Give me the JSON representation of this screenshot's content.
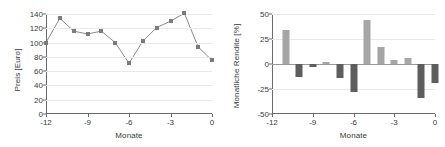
{
  "chart_data": [
    {
      "type": "line",
      "panel": "left",
      "title": "",
      "xlabel": "Monate",
      "ylabel": "Preis [Euro]",
      "x": [
        -12,
        -11,
        -10,
        -9,
        -8,
        -7,
        -6,
        -5,
        -4,
        -3,
        -2,
        -1,
        0
      ],
      "values": [
        100,
        134,
        116,
        112,
        116,
        100,
        71,
        102,
        121,
        130,
        141,
        94,
        75
      ],
      "xlim": [
        -12,
        0
      ],
      "ylim": [
        0,
        140
      ],
      "xticks": [
        -12,
        -9,
        -6,
        -3,
        0
      ],
      "xticklabels": [
        "-12",
        "-9",
        "-6",
        "-3",
        "0"
      ],
      "yticks": [
        0,
        20,
        40,
        60,
        80,
        100,
        120,
        140
      ],
      "yticklabels": [
        "0",
        "20",
        "40",
        "60",
        "80",
        "100",
        "120",
        "140"
      ],
      "grid": true,
      "legend": "none",
      "marker_color": "#7b7b7b",
      "line_color": "#8a8a8a"
    },
    {
      "type": "bar",
      "panel": "right",
      "title": "",
      "xlabel": "Monate",
      "ylabel": "Monatliche Rendite [%]",
      "categories": [
        -11,
        -10,
        -9,
        -8,
        -7,
        -6,
        -5,
        -4,
        -3,
        -2,
        -1,
        0
      ],
      "values": [
        34,
        -13,
        -3,
        2,
        -14,
        -28,
        44,
        17,
        4,
        6,
        -34,
        -19
      ],
      "xlim": [
        -12,
        0
      ],
      "ylim": [
        -50,
        50
      ],
      "xticks": [
        -12,
        -9,
        -6,
        -3,
        0
      ],
      "xticklabels": [
        "-12",
        "-9",
        "-6",
        "-3",
        "0"
      ],
      "yticks": [
        -50,
        -25,
        0,
        25,
        50
      ],
      "yticklabels": [
        "-50",
        "-25",
        "0",
        "25",
        "50"
      ],
      "grid": true,
      "legend": "none",
      "positive_color": "#a6a6a6",
      "negative_color": "#5e5e5e"
    }
  ]
}
